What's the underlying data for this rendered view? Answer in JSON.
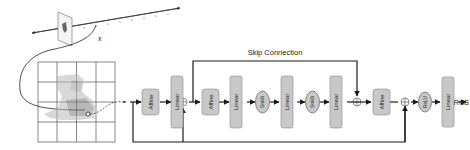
{
  "diagram": {
    "skip_label": "Skip Connection",
    "x_label": "x",
    "output_label": "RGB",
    "colors": {
      "block_fill": "#c8c8c8",
      "block_stroke": "#8a8a8a",
      "line": "#1a1a1a",
      "grid": "#555555",
      "text": "#222222"
    },
    "blocks": [
      {
        "id": "affine-1",
        "label": "Affine",
        "shape": "rect"
      },
      {
        "id": "linear-1",
        "label": "Linear",
        "shape": "rect"
      },
      {
        "id": "affine-2",
        "label": "Affine",
        "shape": "rect"
      },
      {
        "id": "linear-2",
        "label": "Linear",
        "shape": "rect"
      },
      {
        "id": "swish-1",
        "label": "Swish",
        "shape": "ellipse"
      },
      {
        "id": "linear-3",
        "label": "Linear",
        "shape": "rect"
      },
      {
        "id": "swish-2",
        "label": "Swish",
        "shape": "ellipse"
      },
      {
        "id": "linear-4",
        "label": "Linear",
        "shape": "rect"
      },
      {
        "id": "affine-3",
        "label": "Affine",
        "shape": "rect"
      },
      {
        "id": "relu-1",
        "label": "ReLU",
        "shape": "ellipse"
      },
      {
        "id": "linear-5",
        "label": "Linear",
        "shape": "rect"
      }
    ]
  }
}
